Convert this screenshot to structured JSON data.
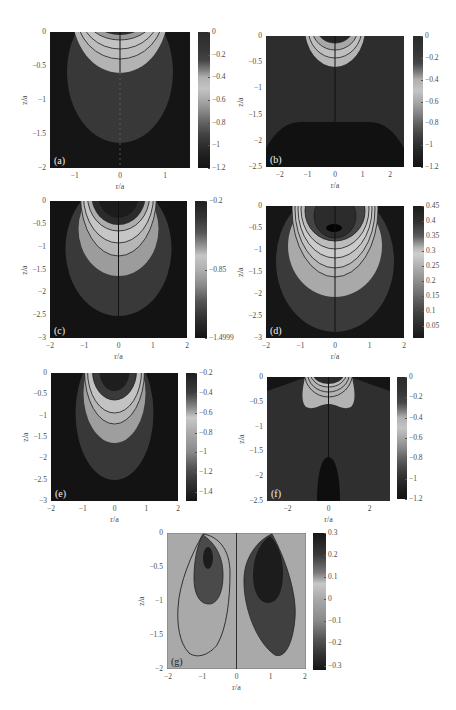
{
  "figure": {
    "panel_count": 7,
    "background": "#ffffff"
  },
  "chart_data": [
    {
      "panel_label": "(a)",
      "type": "heatmap",
      "subtype": "filled contour",
      "xlabel": "r/a",
      "ylabel": "z/a",
      "xlim": [
        -1.55,
        1.55
      ],
      "ylim": [
        -2,
        0
      ],
      "x_ticks": [
        {
          "v": -1,
          "label": "−1"
        },
        {
          "v": 0,
          "label": "0"
        },
        {
          "v": 1,
          "label": "1"
        }
      ],
      "y_ticks": [
        {
          "v": 0,
          "label": "0"
        },
        {
          "v": -0.5,
          "label": "−0.5"
        },
        {
          "v": -1,
          "label": "−1"
        },
        {
          "v": -1.5,
          "label": "−1.5"
        },
        {
          "v": -2,
          "label": "−2"
        }
      ],
      "colors": {
        "background": "#151515",
        "outer": "#383838",
        "light": "#b3b3b3"
      },
      "colorbar": {
        "range": [
          -1.2,
          0
        ],
        "ticks": [
          {
            "v": 0,
            "label": "0"
          },
          {
            "v": -0.2,
            "label": "−0.2"
          },
          {
            "v": -0.4,
            "label": "−0.4"
          },
          {
            "v": -0.6,
            "label": "−0.6"
          },
          {
            "v": -0.8,
            "label": "−0.8"
          },
          {
            "v": -1,
            "label": "−1"
          },
          {
            "v": -1.2,
            "label": "−1.2"
          }
        ],
        "stops": [
          [
            0,
            "#2b2b2b"
          ],
          [
            -0.15,
            "#363636"
          ],
          [
            -0.25,
            "#454545"
          ],
          [
            -0.33,
            "#7a7a7a"
          ],
          [
            -0.4,
            "#b0b0b0"
          ],
          [
            -0.5,
            "#c4c4c4"
          ],
          [
            -0.6,
            "#a8a8a8"
          ],
          [
            -0.7,
            "#888888"
          ],
          [
            -0.8,
            "#626262"
          ],
          [
            -0.9,
            "#444444"
          ],
          [
            -1.0,
            "#2e2e2e"
          ],
          [
            -1.1,
            "#1e1e1e"
          ],
          [
            -1.2,
            "#141414"
          ]
        ]
      }
    },
    {
      "panel_label": "(b)",
      "type": "heatmap",
      "subtype": "filled contour",
      "xlabel": "r/a",
      "ylabel": "z/a",
      "xlim": [
        -2.5,
        2.5
      ],
      "ylim": [
        -2.5,
        0
      ],
      "x_ticks": [
        {
          "v": -2,
          "label": "−2"
        },
        {
          "v": -1,
          "label": "−1"
        },
        {
          "v": 0,
          "label": "0"
        },
        {
          "v": 1,
          "label": "1"
        },
        {
          "v": 2,
          "label": "2"
        }
      ],
      "y_ticks": [
        {
          "v": 0,
          "label": "0"
        },
        {
          "v": -0.5,
          "label": "−0.5"
        },
        {
          "v": -1,
          "label": "−1"
        },
        {
          "v": -1.5,
          "label": "−1.5"
        },
        {
          "v": -2,
          "label": "−2"
        },
        {
          "v": -2.5,
          "label": "−2.5"
        }
      ],
      "colors": {
        "background": "#2d2d2d",
        "mound": "#111111",
        "light": "#b5b5b5"
      },
      "colorbar": {
        "range": [
          -1.2,
          0
        ],
        "ticks": [
          {
            "v": 0,
            "label": "0"
          },
          {
            "v": -0.2,
            "label": "−0.2"
          },
          {
            "v": -0.4,
            "label": "−0.4"
          },
          {
            "v": -0.6,
            "label": "−0.6"
          },
          {
            "v": -0.8,
            "label": "−0.8"
          },
          {
            "v": -1,
            "label": "−1"
          },
          {
            "v": -1.2,
            "label": "−1.2"
          }
        ],
        "stops": [
          [
            0,
            "#2b2b2b"
          ],
          [
            -0.15,
            "#363636"
          ],
          [
            -0.25,
            "#454545"
          ],
          [
            -0.33,
            "#7a7a7a"
          ],
          [
            -0.4,
            "#b0b0b0"
          ],
          [
            -0.5,
            "#c4c4c4"
          ],
          [
            -0.6,
            "#a8a8a8"
          ],
          [
            -0.7,
            "#888888"
          ],
          [
            -0.8,
            "#626262"
          ],
          [
            -0.9,
            "#444444"
          ],
          [
            -1.0,
            "#2e2e2e"
          ],
          [
            -1.1,
            "#1e1e1e"
          ],
          [
            -1.2,
            "#141414"
          ]
        ]
      }
    },
    {
      "panel_label": "(c)",
      "type": "heatmap",
      "subtype": "filled contour",
      "xlabel": "r/a",
      "ylabel": "z/a",
      "xlim": [
        -2,
        2
      ],
      "ylim": [
        -3,
        0
      ],
      "x_ticks": [
        {
          "v": -2,
          "label": "−2"
        },
        {
          "v": -1,
          "label": "−1"
        },
        {
          "v": 0,
          "label": "0"
        },
        {
          "v": 1,
          "label": "1"
        },
        {
          "v": 2,
          "label": "2"
        }
      ],
      "y_ticks": [
        {
          "v": 0,
          "label": "0"
        },
        {
          "v": -0.5,
          "label": "−0.5"
        },
        {
          "v": -1,
          "label": "−1"
        },
        {
          "v": -1.5,
          "label": "−1.5"
        },
        {
          "v": -2,
          "label": "−2"
        },
        {
          "v": -2.5,
          "label": "−2.5"
        },
        {
          "v": -3,
          "label": "−3"
        }
      ],
      "colors": {
        "background": "#131313",
        "outer": "#393939",
        "light": "#9c9c9c"
      },
      "colorbar": {
        "range": [
          -1.4999,
          -0.2
        ],
        "ticks": [
          {
            "v": -0.2,
            "label": "−0.2"
          },
          {
            "v": -0.85,
            "label": "−0.85"
          },
          {
            "v": -1.4999,
            "label": "−1.4999"
          }
        ],
        "stops": [
          [
            -0.2,
            "#1e1e1e"
          ],
          [
            -0.35,
            "#333333"
          ],
          [
            -0.5,
            "#555555"
          ],
          [
            -0.62,
            "#909090"
          ],
          [
            -0.72,
            "#c6c6c6"
          ],
          [
            -0.85,
            "#b0b0b0"
          ],
          [
            -1.0,
            "#8a8a8a"
          ],
          [
            -1.15,
            "#555555"
          ],
          [
            -1.3,
            "#333333"
          ],
          [
            -1.4999,
            "#141414"
          ]
        ]
      }
    },
    {
      "panel_label": "(d)",
      "type": "heatmap",
      "subtype": "filled contour",
      "xlabel": "r/a",
      "ylabel": "z/a",
      "xlim": [
        -2,
        2
      ],
      "ylim": [
        -3,
        0
      ],
      "x_ticks": [
        {
          "v": -2,
          "label": "−2"
        },
        {
          "v": -1,
          "label": "−1"
        },
        {
          "v": 0,
          "label": "0"
        },
        {
          "v": 1,
          "label": "1"
        },
        {
          "v": 2,
          "label": "2"
        }
      ],
      "y_ticks": [
        {
          "v": 0,
          "label": "0"
        },
        {
          "v": -0.5,
          "label": "−0.5"
        },
        {
          "v": -1,
          "label": "−1"
        },
        {
          "v": -1.5,
          "label": "−1.5"
        },
        {
          "v": -2,
          "label": "−2"
        },
        {
          "v": -2.5,
          "label": "−2.5"
        },
        {
          "v": -3,
          "label": "−3"
        }
      ],
      "colors": {
        "background": "#161616",
        "outer": "#3a3a3a",
        "light": "#a9a9a9"
      },
      "colorbar": {
        "range": [
          0.01,
          0.45
        ],
        "ticks": [
          {
            "v": 0.45,
            "label": "0.45"
          },
          {
            "v": 0.4,
            "label": "0.4"
          },
          {
            "v": 0.35,
            "label": "0.35"
          },
          {
            "v": 0.3,
            "label": "0.3"
          },
          {
            "v": 0.25,
            "label": "0.25"
          },
          {
            "v": 0.2,
            "label": "0.2"
          },
          {
            "v": 0.15,
            "label": "0.15"
          },
          {
            "v": 0.1,
            "label": "0.1"
          },
          {
            "v": 0.05,
            "label": "0.05"
          }
        ],
        "stops": [
          [
            0.45,
            "#1c1c1c"
          ],
          [
            0.4,
            "#2e2e2e"
          ],
          [
            0.35,
            "#5a5a5a"
          ],
          [
            0.31,
            "#b5b5b5"
          ],
          [
            0.29,
            "#cfcfcf"
          ],
          [
            0.25,
            "#b0b0b0"
          ],
          [
            0.2,
            "#8e8e8e"
          ],
          [
            0.15,
            "#6a6a6a"
          ],
          [
            0.1,
            "#454545"
          ],
          [
            0.05,
            "#2a2a2a"
          ],
          [
            0.01,
            "#181818"
          ]
        ]
      }
    },
    {
      "panel_label": "(e)",
      "type": "heatmap",
      "subtype": "filled contour",
      "xlabel": "r/a",
      "ylabel": "z/a",
      "xlim": [
        -2,
        2
      ],
      "ylim": [
        -3,
        0
      ],
      "x_ticks": [
        {
          "v": -2,
          "label": "−2"
        },
        {
          "v": -1,
          "label": "−1"
        },
        {
          "v": 0,
          "label": "0"
        },
        {
          "v": 1,
          "label": "1"
        },
        {
          "v": 2,
          "label": "2"
        }
      ],
      "y_ticks": [
        {
          "v": 0,
          "label": "0"
        },
        {
          "v": -0.5,
          "label": "−0.5"
        },
        {
          "v": -1,
          "label": "−1"
        },
        {
          "v": -1.5,
          "label": "−1.5"
        },
        {
          "v": -2,
          "label": "−2"
        },
        {
          "v": -2.5,
          "label": "−2.5"
        },
        {
          "v": -3,
          "label": "−3"
        }
      ],
      "colors": {
        "background": "#131313",
        "outer": "#383838",
        "light": "#9e9e9e"
      },
      "colorbar": {
        "range": [
          -1.49,
          -0.2
        ],
        "ticks": [
          {
            "v": -0.2,
            "label": "−0.2"
          },
          {
            "v": -0.4,
            "label": "−0.4"
          },
          {
            "v": -0.6,
            "label": "−0.6"
          },
          {
            "v": -0.8,
            "label": "−0.8"
          },
          {
            "v": -1,
            "label": "−1"
          },
          {
            "v": -1.2,
            "label": "−1.2"
          },
          {
            "v": -1.4,
            "label": "−1.4"
          }
        ],
        "stops": [
          [
            -0.2,
            "#1e1e1e"
          ],
          [
            -0.4,
            "#3e3e3e"
          ],
          [
            -0.55,
            "#8a8a8a"
          ],
          [
            -0.65,
            "#c8c8c8"
          ],
          [
            -0.8,
            "#aaaaaa"
          ],
          [
            -1.0,
            "#888888"
          ],
          [
            -1.15,
            "#555555"
          ],
          [
            -1.3,
            "#333333"
          ],
          [
            -1.49,
            "#141414"
          ]
        ]
      }
    },
    {
      "panel_label": "(f)",
      "type": "heatmap",
      "subtype": "filled contour",
      "xlabel": "r/a",
      "ylabel": "z/a",
      "xlim": [
        -3,
        3
      ],
      "ylim": [
        -2.5,
        0
      ],
      "x_ticks": [
        {
          "v": -2,
          "label": "−2"
        },
        {
          "v": 0,
          "label": "0"
        },
        {
          "v": 2,
          "label": "2"
        }
      ],
      "y_ticks": [
        {
          "v": 0,
          "label": "0"
        },
        {
          "v": -0.5,
          "label": "−0.5"
        },
        {
          "v": -1,
          "label": "−1"
        },
        {
          "v": -1.5,
          "label": "−1.5"
        },
        {
          "v": -2,
          "label": "−2"
        },
        {
          "v": -2.5,
          "label": "−2.5"
        }
      ],
      "colors": {
        "background": "#2f2f2f",
        "corners": "#151515",
        "light": "#b3b3b3",
        "bullet": "#0e0e0e"
      },
      "colorbar": {
        "range": [
          -1.2,
          0
        ],
        "ticks": [
          {
            "v": 0,
            "label": "0"
          },
          {
            "v": -0.2,
            "label": "−0.2"
          },
          {
            "v": -0.4,
            "label": "−0.4"
          },
          {
            "v": -0.6,
            "label": "−0.6"
          },
          {
            "v": -0.8,
            "label": "−0.8"
          },
          {
            "v": -1,
            "label": "−1"
          },
          {
            "v": -1.2,
            "label": "−1.2"
          }
        ],
        "stops": [
          [
            0,
            "#2b2b2b"
          ],
          [
            -0.15,
            "#363636"
          ],
          [
            -0.25,
            "#454545"
          ],
          [
            -0.33,
            "#7a7a7a"
          ],
          [
            -0.4,
            "#b0b0b0"
          ],
          [
            -0.5,
            "#c4c4c4"
          ],
          [
            -0.6,
            "#a8a8a8"
          ],
          [
            -0.7,
            "#888888"
          ],
          [
            -0.8,
            "#626262"
          ],
          [
            -0.9,
            "#444444"
          ],
          [
            -1.0,
            "#2e2e2e"
          ],
          [
            -1.1,
            "#1e1e1e"
          ],
          [
            -1.2,
            "#141414"
          ]
        ]
      }
    },
    {
      "panel_label": "(g)",
      "type": "heatmap",
      "subtype": "filled contour",
      "xlabel": "r/a",
      "ylabel": "z/a",
      "xlim": [
        -2.03,
        2.03
      ],
      "ylim": [
        -2,
        0
      ],
      "x_ticks": [
        {
          "v": -2,
          "label": "−2"
        },
        {
          "v": -1,
          "label": "−1"
        },
        {
          "v": 0,
          "label": "0"
        },
        {
          "v": 1,
          "label": "1"
        },
        {
          "v": 2,
          "label": "2"
        }
      ],
      "y_ticks": [
        {
          "v": 0,
          "label": "0"
        },
        {
          "v": -0.5,
          "label": "−0.5"
        },
        {
          "v": -1,
          "label": "−1"
        },
        {
          "v": -1.5,
          "label": "−1.5"
        },
        {
          "v": -2,
          "label": "−2"
        }
      ],
      "colors": {
        "background": "#a9a9a9",
        "left_lobe": "#4a4a4a",
        "right_lobe": "#404040",
        "core": "#1c1c1c"
      },
      "colorbar": {
        "range": [
          -0.32,
          0.3
        ],
        "ticks": [
          {
            "v": 0.3,
            "label": "0.3"
          },
          {
            "v": 0.2,
            "label": "0.2"
          },
          {
            "v": 0.1,
            "label": "0.1"
          },
          {
            "v": 0,
            "label": "0"
          },
          {
            "v": -0.1,
            "label": "−0.1"
          },
          {
            "v": -0.2,
            "label": "−0.2"
          },
          {
            "v": -0.3,
            "label": "−0.3"
          }
        ],
        "stops": [
          [
            0.3,
            "#161616"
          ],
          [
            0.2,
            "#3a3a3a"
          ],
          [
            0.12,
            "#7a7a7a"
          ],
          [
            0.07,
            "#c8c8c8"
          ],
          [
            0,
            "#a8a8a8"
          ],
          [
            -0.1,
            "#888888"
          ],
          [
            -0.18,
            "#555555"
          ],
          [
            -0.25,
            "#333333"
          ],
          [
            -0.32,
            "#151515"
          ]
        ]
      }
    }
  ]
}
